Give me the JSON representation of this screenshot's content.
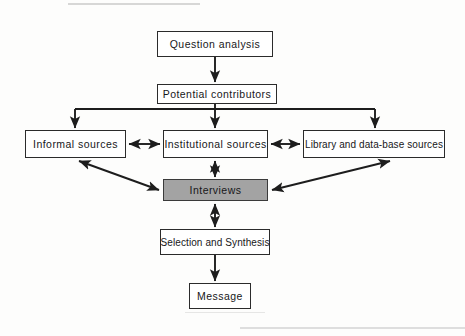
{
  "figure": {
    "background_color": "#fdfdfc",
    "line_color": "#1d1d1d",
    "shaded_fill": "#a3a3a3"
  },
  "nodes": {
    "question_analysis": {
      "label": "Question analysis",
      "x": 157,
      "y": 31,
      "w": 116,
      "h": 26,
      "shaded": false
    },
    "potential_contributors": {
      "label": "Potential contributors",
      "x": 157,
      "y": 84,
      "w": 120,
      "h": 20,
      "shaded": false
    },
    "informal_sources": {
      "label": "Informal sources",
      "x": 25,
      "y": 130,
      "w": 101,
      "h": 28,
      "shaded": false
    },
    "institutional_sources": {
      "label": "Institutional sources",
      "x": 163,
      "y": 130,
      "w": 105,
      "h": 28,
      "shaded": false
    },
    "library_sources": {
      "label": "Library and data-base sources",
      "x": 303,
      "y": 130,
      "w": 142,
      "h": 28,
      "shaded": false
    },
    "interviews": {
      "label": "Interviews",
      "x": 163,
      "y": 179,
      "w": 105,
      "h": 22,
      "shaded": true
    },
    "selection_and_synthesis": {
      "label": "Selection and Synthesis",
      "x": 160,
      "y": 229,
      "w": 110,
      "h": 26,
      "shaded": false
    },
    "message": {
      "label": "Message",
      "x": 189,
      "y": 283,
      "w": 62,
      "h": 26,
      "shaded": false
    }
  },
  "edges": [
    {
      "name": "question-analysis-to-potential-contributors",
      "from": "question_analysis",
      "to": "potential_contributors",
      "style": "single-arrow",
      "direction": "down"
    },
    {
      "name": "potential-contributors-to-informal-sources",
      "from": "potential_contributors",
      "to": "informal_sources",
      "style": "single-arrow",
      "direction": "down-branch-left"
    },
    {
      "name": "potential-contributors-to-institutional-sources",
      "from": "potential_contributors",
      "to": "institutional_sources",
      "style": "single-arrow",
      "direction": "down-branch-center"
    },
    {
      "name": "potential-contributors-to-library-sources",
      "from": "potential_contributors",
      "to": "library_sources",
      "style": "single-arrow",
      "direction": "down-branch-right"
    },
    {
      "name": "informal-sources-institutional-sources",
      "from": "informal_sources",
      "to": "institutional_sources",
      "style": "double-arrow",
      "direction": "horizontal"
    },
    {
      "name": "institutional-sources-library-sources",
      "from": "institutional_sources",
      "to": "library_sources",
      "style": "double-arrow",
      "direction": "horizontal"
    },
    {
      "name": "institutional-sources-interviews",
      "from": "institutional_sources",
      "to": "interviews",
      "style": "double-arrow",
      "direction": "vertical"
    },
    {
      "name": "informal-sources-interviews",
      "from": "informal_sources",
      "to": "interviews",
      "style": "double-arrow",
      "direction": "diagonal"
    },
    {
      "name": "library-sources-interviews",
      "from": "library_sources",
      "to": "interviews",
      "style": "double-arrow",
      "direction": "diagonal"
    },
    {
      "name": "interviews-selection-and-synthesis",
      "from": "interviews",
      "to": "selection_and_synthesis",
      "style": "double-arrow",
      "direction": "vertical"
    },
    {
      "name": "selection-and-synthesis-to-message",
      "from": "selection_and_synthesis",
      "to": "message",
      "style": "single-arrow",
      "direction": "down"
    }
  ]
}
